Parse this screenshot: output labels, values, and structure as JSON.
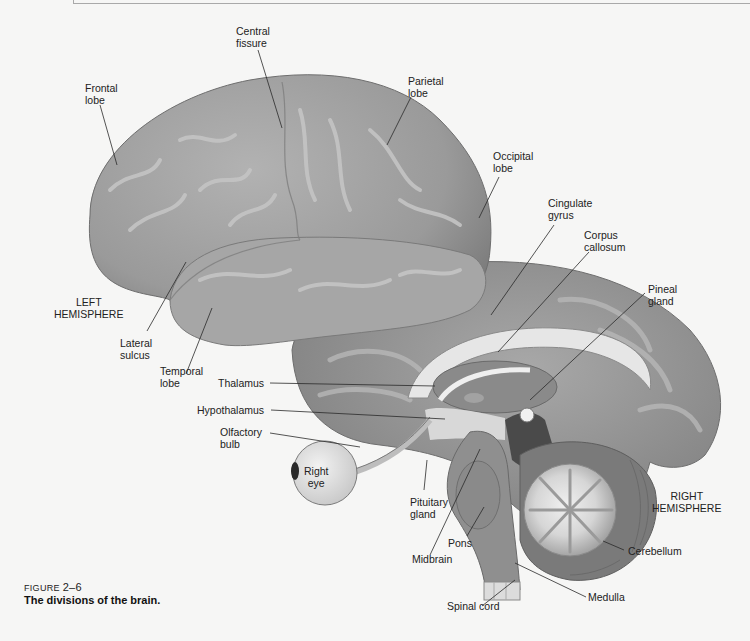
{
  "figure": {
    "number_prefix": "FIGURE",
    "number": "2–6",
    "title": "The divisions of the brain."
  },
  "labels": {
    "central_fissure": "Central\nfissure",
    "frontal_lobe": "Frontal\nlobe",
    "parietal_lobe": "Parietal\nlobe",
    "occipital_lobe": "Occipital\nlobe",
    "cingulate_gyrus": "Cingulate\ngyrus",
    "corpus_callosum": "Corpus\ncallosum",
    "pineal_gland": "Pineal\ngland",
    "left_hemisphere": "LEFT\nHEMISPHERE",
    "lateral_sulcus": "Lateral\nsulcus",
    "temporal_lobe": "Temporal\nlobe",
    "thalamus": "Thalamus",
    "hypothalamus": "Hypothalamus",
    "olfactory_bulb": "Olfactory\nbulb",
    "right_eye": "Right\neye",
    "pituitary_gland": "Pituitary\ngland",
    "pons": "Pons",
    "midbrain": "Midbrain",
    "right_hemisphere": "RIGHT\nHEMISPHERE",
    "cerebellum": "Cerebellum",
    "medulla": "Medulla",
    "spinal_cord": "Spinal cord"
  },
  "colors": {
    "background": "#f6f6f5",
    "cortex": "#9c9c9c",
    "cortex_highlight": "#bdbdbd",
    "cortex_shadow": "#7a7a7a",
    "white_matter": "#e2e2e2",
    "deep_structure": "#8a8a8a",
    "dark_ventricle": "#4a4a4a",
    "leader_line": "#2a2a2a"
  }
}
